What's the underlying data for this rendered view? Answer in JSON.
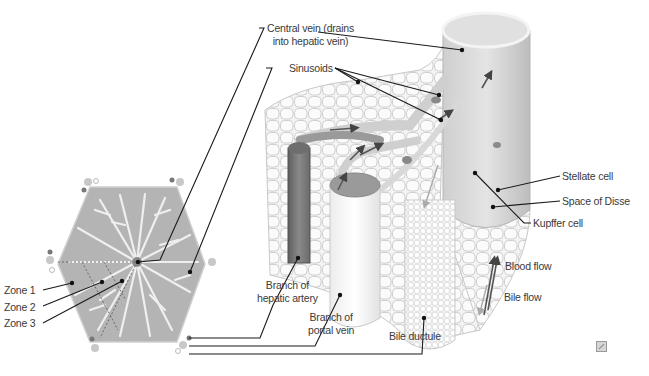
{
  "figure": {
    "labels": {
      "central_vein_line1": "Central vein (drains",
      "central_vein_line2": "into hepatic vein)",
      "sinusoids": "Sinusoids",
      "stellate_cell": "Stellate cell",
      "space_of_disse": "Space of Disse",
      "kupffer_cell": "Kupffer cell",
      "blood_flow": "Blood flow",
      "bile_flow": "Bile flow",
      "zone1": "Zone 1",
      "zone2": "Zone 2",
      "zone3": "Zone 3",
      "hepatic_artery_line1": "Branch of",
      "hepatic_artery_line2": "hepatic artery",
      "portal_vein_line1": "Branch of",
      "portal_vein_line2": "portal vein",
      "bile_ductule": "Bile ductule"
    },
    "colors": {
      "leader_line": "#1a1a1a",
      "hepatocyte_fill": "#f2f2f2",
      "hepatocyte_stroke": "#bdbdbd",
      "lobule_fill": "#a8a8a8",
      "central_vein_fill": "#d9d9d9",
      "artery_fill": "#7a7a7a",
      "portal_fill": "#fafafa",
      "blood_arrow": "#555555",
      "bile_arrow": "#b0b0b0"
    }
  }
}
